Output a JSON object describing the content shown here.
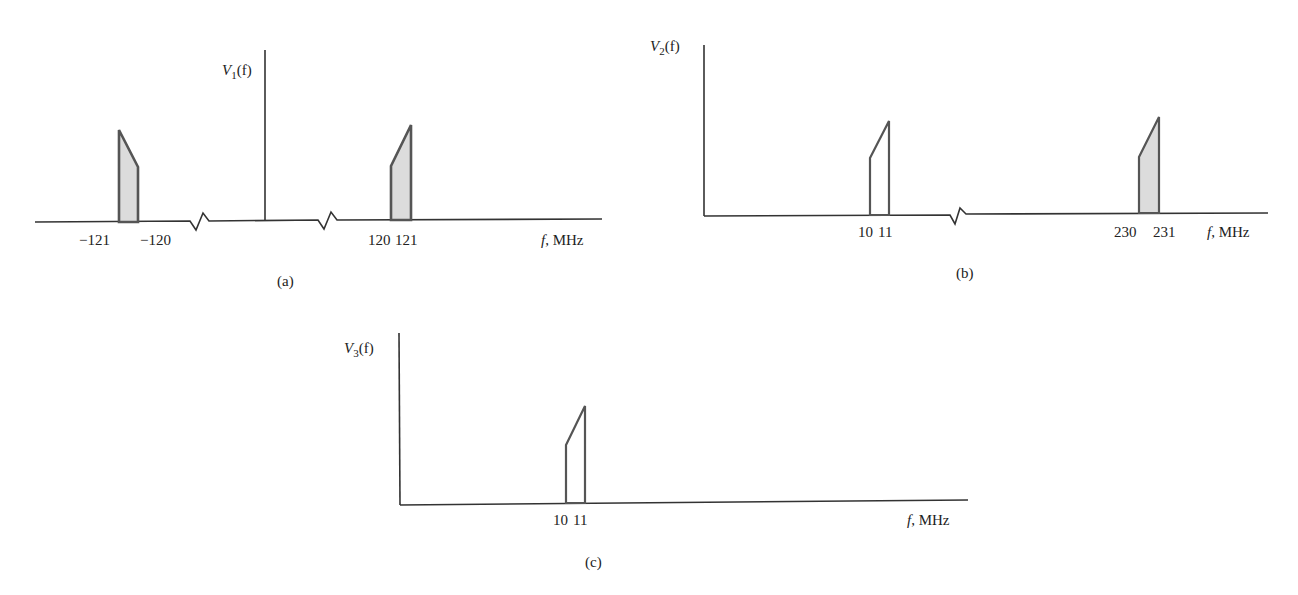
{
  "figure": {
    "panels": [
      {
        "id": "a",
        "caption": "(a)",
        "ylabel": "V",
        "ylabel_sub": "1",
        "ylabel_arg": "(f)",
        "xlabel_f": "f",
        "xlabel_unit": ", MHz",
        "ticks": [
          "−121",
          "−120",
          "120",
          "121"
        ],
        "bands": [
          {
            "from": -121,
            "to": -120,
            "height_at_from": 1.0,
            "height_at_to": 0.55,
            "shaded": true
          },
          {
            "from": 120,
            "to": 121,
            "height_at_from": 0.55,
            "height_at_to": 1.0,
            "shaded": true
          }
        ],
        "axis_breaks": 2
      },
      {
        "id": "b",
        "caption": "(b)",
        "ylabel": "V",
        "ylabel_sub": "2",
        "ylabel_arg": "(f)",
        "xlabel_f": "f",
        "xlabel_unit": ", MHz",
        "ticks": [
          "10",
          "11",
          "230",
          "231"
        ],
        "bands": [
          {
            "from": 10,
            "to": 11,
            "height_at_from": 0.55,
            "height_at_to": 1.0,
            "shaded": false
          },
          {
            "from": 230,
            "to": 231,
            "height_at_from": 0.55,
            "height_at_to": 1.0,
            "shaded": true
          }
        ],
        "axis_breaks": 1
      },
      {
        "id": "c",
        "caption": "(c)",
        "ylabel": "V",
        "ylabel_sub": "3",
        "ylabel_arg": "(f)",
        "xlabel_f": "f",
        "xlabel_unit": ", MHz",
        "ticks": [
          "10",
          "11"
        ],
        "bands": [
          {
            "from": 10,
            "to": 11,
            "height_at_from": 0.55,
            "height_at_to": 1.0,
            "shaded": false
          }
        ],
        "axis_breaks": 0
      }
    ],
    "colors": {
      "shade": "#dcdcdc",
      "line": "#555555",
      "axis": "#333333"
    }
  }
}
